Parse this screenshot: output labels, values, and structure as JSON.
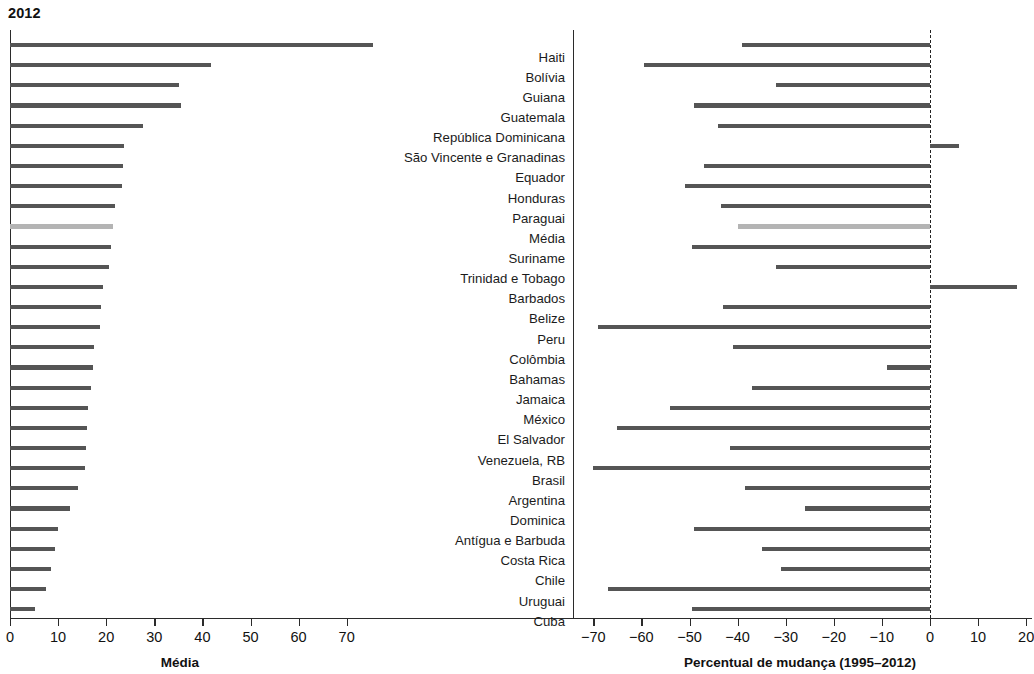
{
  "title": "2012",
  "left_panel": {
    "axis_title": "Média",
    "ticks": [
      0,
      10,
      20,
      30,
      40,
      50,
      60,
      70
    ],
    "tick_labels": [
      "0",
      "10",
      "20",
      "30",
      "40",
      "50",
      "60",
      "70"
    ]
  },
  "right_panel": {
    "axis_title": "Percentual de mudança (1995–2012)",
    "ticks": [
      -70,
      -60,
      -50,
      -40,
      -30,
      -20,
      -10,
      0,
      10,
      20
    ],
    "tick_labels": [
      "−70",
      "−60",
      "−50",
      "−40",
      "−30",
      "−20",
      "−10",
      "0",
      "10",
      "20"
    ]
  },
  "colors": {
    "bar": "#555555",
    "bar_highlight": "#b4b4b4",
    "axis": "#2b2b2b",
    "text": "#1a1a1a",
    "background": "#ffffff"
  },
  "chart_data": {
    "type": "bar",
    "title": "2012",
    "orientation": "horizontal",
    "panels": 2,
    "grid": false,
    "legend": false,
    "categories": [
      "Haiti",
      "Bolívia",
      "Guiana",
      "Guatemala",
      "República Dominicana",
      "São Vincente e Granadinas",
      "Equador",
      "Honduras",
      "Paraguai",
      "Média",
      "Suriname",
      "Trinidad e Tobago",
      "Barbados",
      "Belize",
      "Peru",
      "Colômbia",
      "Bahamas",
      "Jamaica",
      "México",
      "El Salvador",
      "Venezuela, RB",
      "Brasil",
      "Argentina",
      "Dominica",
      "Antígua e Barbuda",
      "Costa Rica",
      "Chile",
      "Uruguai",
      "Cuba"
    ],
    "highlight_category": "Média",
    "series": [
      {
        "name": "Média",
        "panel": "left",
        "xlabel": "Média",
        "ylabel": "",
        "xlim": [
          0,
          78
        ],
        "values": [
          75.4,
          41.7,
          35.2,
          35.5,
          27.7,
          23.8,
          23.5,
          23.2,
          21.9,
          21.5,
          21.0,
          20.5,
          19.3,
          19.0,
          18.8,
          17.5,
          17.3,
          16.9,
          16.3,
          16.0,
          15.7,
          15.5,
          14.2,
          12.5,
          10.0,
          9.4,
          8.6,
          7.4,
          5.2
        ]
      },
      {
        "name": "Percentual de mudança (1995–2012)",
        "panel": "right",
        "xlabel": "Percentual de mudança (1995–2012)",
        "ylabel": "",
        "xlim": [
          -75,
          22
        ],
        "values": [
          -39.0,
          -59.5,
          -32.0,
          -49.0,
          -44.0,
          6.0,
          -47.0,
          -51.0,
          -43.5,
          -40.0,
          -49.5,
          -32.0,
          18.0,
          -43.0,
          -69.0,
          -41.0,
          -9.0,
          -37.0,
          -54.0,
          -65.0,
          -41.5,
          -70.0,
          -38.5,
          -26.0,
          -49.0,
          -35.0,
          -31.0,
          -67.0,
          -49.5
        ]
      }
    ]
  }
}
